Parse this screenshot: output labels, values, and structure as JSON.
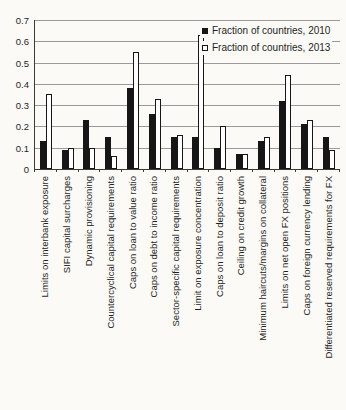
{
  "colors": {
    "bg": "#fbfaf6",
    "bar2010": "#161616",
    "bar2013": "#ffffff",
    "barborder": "#161616",
    "grid": "#9a9a9a",
    "axis": "#3a3a3a",
    "text": "#1f1f1f"
  },
  "chart_data": {
    "type": "bar",
    "title": "",
    "xlabel": "",
    "ylabel": "",
    "ylim": [
      0,
      0.7
    ],
    "yticks": [
      "0.7",
      "0.6",
      "0.5",
      "0.4",
      "0.3",
      "0.2",
      "0.1",
      "0"
    ],
    "grid": "horizontal",
    "legend_position": "top-right",
    "categories": [
      "Limits on interbank exposure",
      "SIFI capital surcharges",
      "Dynamic provisioning",
      "Countercyclical capital requirements",
      "Caps on loan to value ratio",
      "Caps on debt to income ratio",
      "Sector-specific capital requirements",
      "Limit on exposure concentration",
      "Caps on loan to deposit ratio",
      "Ceiling on credit growth",
      "Minimum haircuts/margins on collateral",
      "Limits on net open FX positions",
      "Caps on foreign currency lending",
      "Differentiated reserved requirements for FX"
    ],
    "series": [
      {
        "name": "Fraction of countries, 2010",
        "fill": "black",
        "values": [
          0.13,
          0.09,
          0.23,
          0.15,
          0.38,
          0.26,
          0.15,
          0.15,
          0.1,
          0.07,
          0.13,
          0.32,
          0.21,
          0.15
        ]
      },
      {
        "name": "Fraction of countries, 2013",
        "fill": "white",
        "values": [
          0.35,
          0.1,
          0.1,
          0.06,
          0.55,
          0.33,
          0.16,
          0.63,
          0.2,
          0.07,
          0.15,
          0.44,
          0.23,
          0.09
        ]
      }
    ]
  }
}
